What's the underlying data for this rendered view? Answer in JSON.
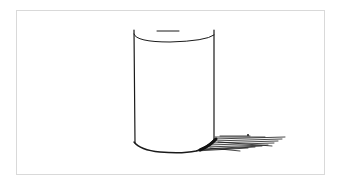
{
  "figure": {
    "frame_color": "#d9d9d9",
    "ink_color": "#1a1a1a",
    "background": "#ffffff"
  }
}
